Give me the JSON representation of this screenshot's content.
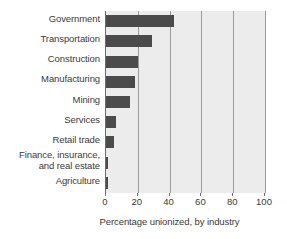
{
  "chart_data": {
    "type": "bar",
    "orientation": "horizontal",
    "title": "",
    "xlabel": "Percentage unionized, by industry",
    "ylabel": "",
    "xlim": [
      0,
      100
    ],
    "xticks": [
      0,
      20,
      40,
      60,
      80,
      100
    ],
    "xtick_labels": [
      "0",
      "20",
      "40",
      "60",
      "80",
      "100"
    ],
    "grid": true,
    "legend": "none",
    "categories": [
      "Government",
      "Transportation",
      "Construction",
      "Manufacturing",
      "Mining",
      "Services",
      "Retail trade",
      "Finance, insurance, and real estate",
      "Agriculture"
    ],
    "category_lines": [
      [
        "Government"
      ],
      [
        "Transportation"
      ],
      [
        "Construction"
      ],
      [
        "Manufacturing"
      ],
      [
        "Mining"
      ],
      [
        "Services"
      ],
      [
        "Retail trade"
      ],
      [
        "Finance, insurance,",
        "and real estate"
      ],
      [
        "Agriculture"
      ]
    ],
    "values": [
      43,
      29,
      20,
      18,
      15,
      6,
      5,
      1.5,
      0.8
    ],
    "bar_color": "#4b4b4b",
    "plot_background": "#ececed",
    "gridline_color": "#9a9a9a",
    "axis_color": "#6d6d6d",
    "text_color": "#3b3b3b"
  }
}
